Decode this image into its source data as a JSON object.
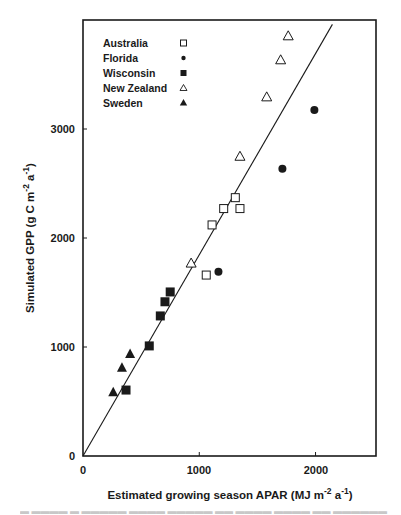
{
  "chart_data": {
    "type": "scatter",
    "title": "",
    "xlabel": "Estimated growing season APAR (MJ m-2 a-1)",
    "ylabel": "Simulated GPP (g C m-2 a-1)",
    "xlabel_parts": {
      "main": "Estimated growing season APAR (MJ m",
      "sup1": "-2",
      "mid": " a",
      "sup2": "-1",
      "end": ")"
    },
    "ylabel_parts": {
      "main": "Simulated GPP (g C m",
      "sup1": "-2",
      "mid": " a",
      "sup2": "-1",
      "end": ")"
    },
    "xlim": [
      0,
      2520
    ],
    "ylim": [
      0,
      4000
    ],
    "xticks": [
      0,
      1000,
      2000
    ],
    "yticks": [
      0,
      1000,
      2000,
      3000
    ],
    "grid": false,
    "legend_position": "upper-left inside",
    "series": [
      {
        "name": "Australia",
        "marker": "open-square",
        "points": [
          [
            1060,
            1660
          ],
          [
            1110,
            2120
          ],
          [
            1210,
            2270
          ],
          [
            1310,
            2370
          ],
          [
            1350,
            2270
          ]
        ]
      },
      {
        "name": "Florida",
        "marker": "filled-circle",
        "points": [
          [
            1165,
            1690
          ],
          [
            1715,
            2635
          ],
          [
            1990,
            3175
          ]
        ]
      },
      {
        "name": "Wisconsin",
        "marker": "filled-square",
        "points": [
          [
            370,
            605
          ],
          [
            570,
            1010
          ],
          [
            665,
            1285
          ],
          [
            705,
            1415
          ],
          [
            750,
            1505
          ]
        ]
      },
      {
        "name": "New Zealand",
        "marker": "open-triangle",
        "points": [
          [
            930,
            1770
          ],
          [
            1350,
            2750
          ],
          [
            1580,
            3295
          ],
          [
            1700,
            3635
          ],
          [
            1765,
            3855
          ]
        ]
      },
      {
        "name": "Sweden",
        "marker": "filled-triangle",
        "points": [
          [
            260,
            585
          ],
          [
            335,
            810
          ],
          [
            405,
            935
          ]
        ]
      }
    ],
    "regression_line": {
      "x": [
        0,
        2145
      ],
      "y": [
        0,
        3960
      ]
    }
  },
  "legend": {
    "items": [
      {
        "label": "Australia"
      },
      {
        "label": "Florida"
      },
      {
        "label": "Wisconsin"
      },
      {
        "label": "New Zealand"
      },
      {
        "label": "Sweden"
      }
    ]
  },
  "axes": {
    "x_tick_labels": [
      "0",
      "1000",
      "2000"
    ],
    "y_tick_labels": [
      "0",
      "1000",
      "2000",
      "3000"
    ]
  },
  "caption": {
    "text": "Figure ... (cut off)"
  }
}
